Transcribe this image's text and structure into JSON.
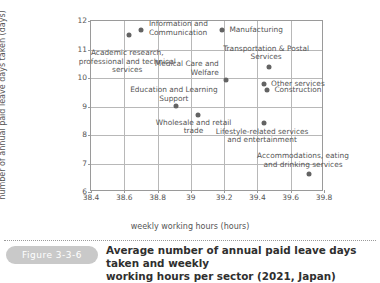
{
  "figure": {
    "tag": "Figure 3-3-6",
    "caption_line1": "Average number of annual paid leave days taken and weekly",
    "caption_line2": "working hours per sector (2021, Japan)"
  },
  "chart_data": {
    "type": "scatter",
    "title": "",
    "xlabel": "weekly working hours (hours)",
    "ylabel": "number of annual paid leave days taken (days)",
    "xlim": [
      38.4,
      39.8
    ],
    "ylim": [
      6,
      12
    ],
    "xticks": [
      "38.4",
      "38.6",
      "38.8",
      "39",
      "39.2",
      "39.4",
      "39.6",
      "39.8"
    ],
    "yticks": [
      "6",
      "7",
      "8",
      "9",
      "10",
      "11",
      "12"
    ],
    "grid": true,
    "legend": "none",
    "point_color": "#636363",
    "points": [
      {
        "label_line1": "Academic research,",
        "label_line2": "professional and technical",
        "label_line3": "services",
        "x": 38.63,
        "y": 11.51
      },
      {
        "label_line1": "Information and",
        "label_line2": "Communication",
        "label_line3": "",
        "x": 38.7,
        "y": 11.68
      },
      {
        "label_line1": "Manufacturing",
        "label_line2": "",
        "label_line3": "",
        "x": 39.19,
        "y": 11.68
      },
      {
        "label_line1": "Transportation & Postal",
        "label_line2": "Services",
        "label_line3": "",
        "x": 39.47,
        "y": 10.4
      },
      {
        "label_line1": "Medical Care and",
        "label_line2": "Welfare",
        "label_line3": "",
        "x": 39.21,
        "y": 9.92
      },
      {
        "label_line1": "Other services",
        "label_line2": "",
        "label_line3": "",
        "x": 39.44,
        "y": 9.8
      },
      {
        "label_line1": "Construction",
        "label_line2": "",
        "label_line3": "",
        "x": 39.46,
        "y": 9.58
      },
      {
        "label_line1": "Education and Learning",
        "label_line2": "Support",
        "label_line3": "",
        "x": 38.91,
        "y": 9.01
      },
      {
        "label_line1": "Wholesale and retail",
        "label_line2": "trade",
        "label_line3": "",
        "x": 39.04,
        "y": 8.71
      },
      {
        "label_line1": "Lifestyle-related services",
        "label_line2": "and entertainment",
        "label_line3": "",
        "x": 39.44,
        "y": 8.43
      },
      {
        "label_line1": "Accommodations, eating",
        "label_line2": "and drinking services",
        "label_line3": "",
        "x": 39.71,
        "y": 6.62
      }
    ]
  }
}
